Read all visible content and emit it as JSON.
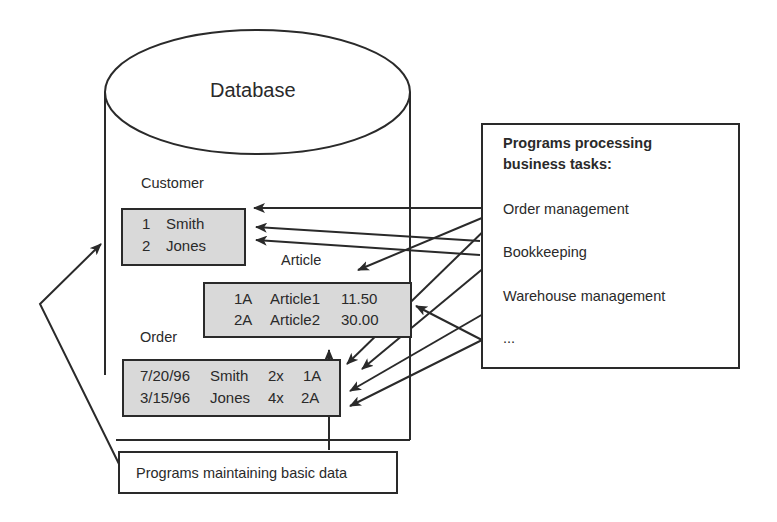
{
  "database": {
    "title": "Database",
    "tables": {
      "customer": {
        "label": "Customer",
        "rows": [
          [
            "1",
            "Smith"
          ],
          [
            "2",
            "Jones"
          ]
        ]
      },
      "article": {
        "label": "Article",
        "rows": [
          [
            "1A",
            "Article1",
            "11.50"
          ],
          [
            "2A",
            "Article2",
            "30.00"
          ]
        ]
      },
      "order": {
        "label": "Order",
        "rows": [
          [
            "7/20/96",
            "Smith",
            "2x",
            "1A"
          ],
          [
            "3/15/96",
            "Jones",
            "4x",
            "2A"
          ]
        ]
      }
    }
  },
  "business_programs": {
    "heading_line1": "Programs processing",
    "heading_line2": "business tasks:",
    "items": [
      {
        "label": "Order management"
      },
      {
        "label": "Bookkeeping"
      },
      {
        "label": "Warehouse management"
      },
      {
        "label": "..."
      }
    ]
  },
  "maintenance_programs": {
    "label": "Programs maintaining basic data"
  },
  "colors": {
    "line": "#2a2a2a",
    "table_fill": "#d9d9d9",
    "background": "#ffffff"
  }
}
